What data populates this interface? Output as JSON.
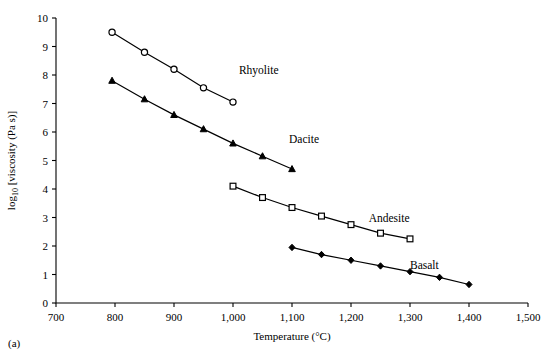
{
  "figure": {
    "panel_caption": "(a)",
    "axis_title_x": "Temperature (°C)",
    "axis_title_y_prefix": "log",
    "axis_title_y_sub": "10",
    "axis_title_y_suffix": " [viscosity (Pa s)]"
  },
  "chart_data": {
    "type": "line",
    "title": "",
    "xlabel": "Temperature (°C)",
    "ylabel": "log10 [viscosity (Pa s)]",
    "xlim": [
      700,
      1500
    ],
    "ylim": [
      0,
      10
    ],
    "xticks": [
      700,
      800,
      900,
      1000,
      1100,
      1200,
      1300,
      1400,
      1500
    ],
    "xticklabels": [
      "700",
      "800",
      "900",
      "1,000",
      "1,100",
      "1,200",
      "1,300",
      "1,400",
      "1,500"
    ],
    "yticks": [
      0,
      1,
      2,
      3,
      4,
      5,
      6,
      7,
      8,
      9,
      10
    ],
    "yticklabels": [
      "0",
      "1",
      "2",
      "3",
      "4",
      "5",
      "6",
      "7",
      "8",
      "9",
      "10"
    ],
    "grid": false,
    "legend": "inline-labels",
    "series": [
      {
        "name": "Rhyolite",
        "marker": "open-circle",
        "label_x": 1010,
        "label_y": 8.05,
        "x": [
          795,
          850,
          900,
          950,
          1000
        ],
        "y": [
          9.5,
          8.8,
          8.2,
          7.55,
          7.05
        ]
      },
      {
        "name": "Dacite",
        "marker": "filled-triangle",
        "label_x": 1095,
        "label_y": 5.6,
        "x": [
          795,
          850,
          900,
          950,
          1000,
          1050,
          1100
        ],
        "y": [
          7.8,
          7.15,
          6.6,
          6.1,
          5.6,
          5.15,
          4.7
        ]
      },
      {
        "name": "Andesite",
        "marker": "open-square",
        "label_x": 1230,
        "label_y": 2.85,
        "x": [
          1000,
          1050,
          1100,
          1150,
          1200,
          1250,
          1300
        ],
        "y": [
          4.1,
          3.7,
          3.35,
          3.05,
          2.75,
          2.45,
          2.25
        ]
      },
      {
        "name": "Basalt",
        "marker": "filled-diamond",
        "label_x": 1300,
        "label_y": 1.2,
        "x": [
          1100,
          1150,
          1200,
          1250,
          1300,
          1350,
          1400
        ],
        "y": [
          1.95,
          1.7,
          1.5,
          1.3,
          1.1,
          0.9,
          0.65
        ]
      }
    ]
  }
}
